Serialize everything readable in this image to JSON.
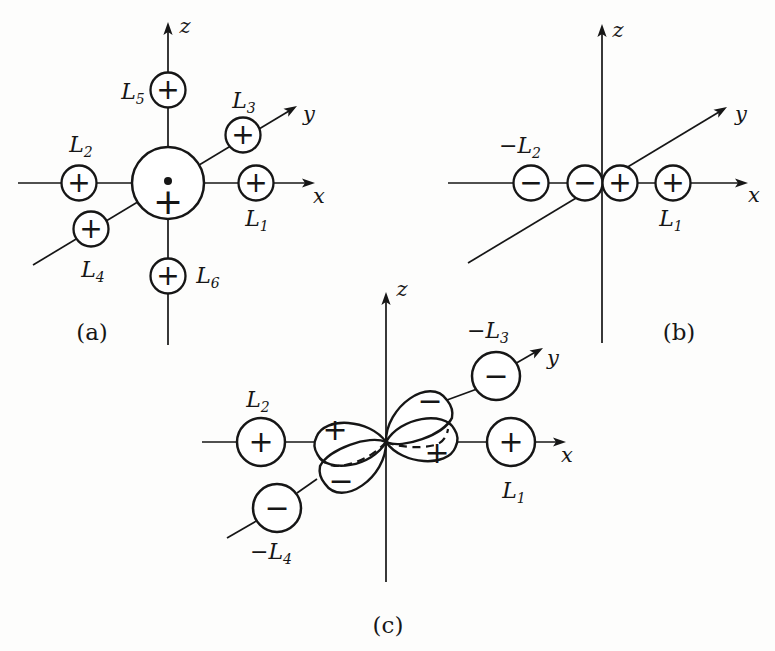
{
  "panels": {
    "a": {
      "caption": "(a)",
      "axes": {
        "x": "x",
        "y": "y",
        "z": "z"
      },
      "central_ion": {
        "sign": "+"
      },
      "ligands": {
        "L1": {
          "prefix": "",
          "base": "L",
          "sub": "1",
          "sign": "+"
        },
        "L2": {
          "prefix": "",
          "base": "L",
          "sub": "2",
          "sign": "+"
        },
        "L3": {
          "prefix": "",
          "base": "L",
          "sub": "3",
          "sign": "+"
        },
        "L4": {
          "prefix": "",
          "base": "L",
          "sub": "4",
          "sign": "+"
        },
        "L5": {
          "prefix": "",
          "base": "L",
          "sub": "5",
          "sign": "+"
        },
        "L6": {
          "prefix": "",
          "base": "L",
          "sub": "6",
          "sign": "+"
        }
      }
    },
    "b": {
      "caption": "(b)",
      "axes": {
        "x": "x",
        "y": "y",
        "z": "z"
      },
      "orbital": {
        "left_lobe_sign": "−",
        "right_lobe_sign": "+"
      },
      "ligands": {
        "L2": {
          "prefix": "−",
          "base": "L",
          "sub": "2",
          "sign": "−"
        },
        "L1": {
          "prefix": "",
          "base": "L",
          "sub": "1",
          "sign": "+"
        }
      }
    },
    "c": {
      "caption": "(c)",
      "axes": {
        "x": "x",
        "y": "y",
        "z": "z"
      },
      "orbital": {
        "upper_left_lobe_sign": "+",
        "upper_right_lobe_sign": "−",
        "lower_left_lobe_sign": "−",
        "lower_right_lobe_sign": "+"
      },
      "ligands": {
        "L2": {
          "prefix": "",
          "base": "L",
          "sub": "2",
          "sign": "+"
        },
        "L1": {
          "prefix": "",
          "base": "L",
          "sub": "1",
          "sign": "+"
        },
        "L3": {
          "prefix": "−",
          "base": "L",
          "sub": "3",
          "sign": "−"
        },
        "L4": {
          "prefix": "−",
          "base": "L",
          "sub": "4",
          "sign": "−"
        }
      }
    }
  },
  "colors": {
    "ink": "#161616",
    "paper": "#fdfdfc"
  }
}
